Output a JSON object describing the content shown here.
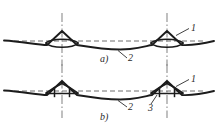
{
  "figure": {
    "width": 218,
    "height": 133,
    "background": "#ffffff",
    "ink_color": "#1c1c1c",
    "centerline_color": "#8c8c8c",
    "reference_line_color": "#6e6e6e",
    "text_color": "#2b2b2b"
  },
  "panels": [
    {
      "id": "panel-a",
      "caption": "a)",
      "profile_style": "curved",
      "description": "wave profile formed by arcs with pointed crests",
      "callouts": [
        {
          "id": "callout-a-1",
          "label": "1",
          "target": "crest-flank"
        },
        {
          "id": "callout-a-2",
          "label": "2",
          "target": "trough-curve"
        }
      ]
    },
    {
      "id": "panel-b",
      "caption": "b)",
      "profile_style": "straight-segment",
      "description": "wave profile formed by straight segments with triangular crests and vertical base lines",
      "callouts": [
        {
          "id": "callout-b-1",
          "label": "1",
          "target": "crest-flank"
        },
        {
          "id": "callout-b-2",
          "label": "2",
          "target": "trough-curve"
        },
        {
          "id": "callout-b-3",
          "label": "3",
          "target": "vertical-base-line"
        }
      ]
    }
  ],
  "annotations": {
    "caption_a": "a)",
    "caption_b": "b)",
    "label_1_a": "1",
    "label_2_a": "2",
    "label_1_b": "1",
    "label_2_b": "2",
    "label_3_b": "3"
  },
  "geometry": {
    "crest_x_left": 62,
    "crest_x_right": 167,
    "panel_a_reference_y": 41,
    "panel_b_reference_y": 91
  }
}
